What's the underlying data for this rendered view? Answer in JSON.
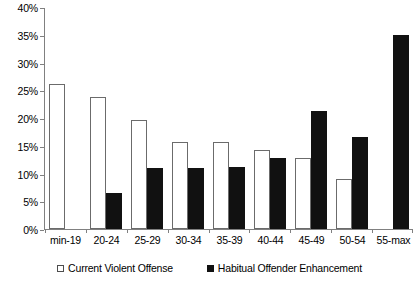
{
  "chart_data": {
    "type": "bar",
    "title": "",
    "xlabel": "",
    "ylabel": "",
    "categories": [
      "min-19",
      "20-24",
      "25-29",
      "30-34",
      "35-39",
      "40-44",
      "45-49",
      "50-54",
      "55-max"
    ],
    "series": [
      {
        "name": "Current Violent Offense",
        "marker": "white-square",
        "color": "#ffffff",
        "border_color": "#6b6b6b",
        "values": [
          26.2,
          23.8,
          19.6,
          15.7,
          15.7,
          14.2,
          12.8,
          9.1,
          0
        ]
      },
      {
        "name": "Habitual Offender Enhancement",
        "marker": "black-square",
        "color": "#111111",
        "border_color": "#111111",
        "values": [
          0,
          6.5,
          11.0,
          11.0,
          11.1,
          12.8,
          21.2,
          16.6,
          34.9
        ]
      }
    ],
    "ylim": [
      0,
      40
    ],
    "ytick_values": [
      0,
      5,
      10,
      15,
      20,
      25,
      30,
      35,
      40
    ],
    "ytick_labels": [
      "0%",
      "5%",
      "10%",
      "15%",
      "20%",
      "25%",
      "30%",
      "35%",
      "40%"
    ],
    "grid": false,
    "legend_position": "bottom"
  },
  "legend": {
    "entries": [
      {
        "label": "Current Violent Offense"
      },
      {
        "label": "Habitual Offender Enhancement"
      }
    ]
  }
}
